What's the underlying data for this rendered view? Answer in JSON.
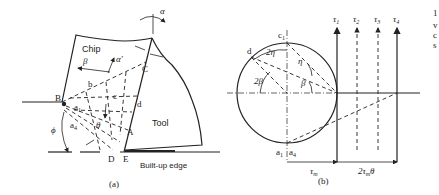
{
  "figure_a": {
    "caption": "(a)",
    "labels": {
      "chip": "Chip",
      "tool": "Tool",
      "built_up_edge": "Built-up edge",
      "alpha": "α",
      "alpha_prime": "α′",
      "beta": "β",
      "theta": "θ",
      "phi": "ϕ",
      "B": "B",
      "C": "C",
      "A": "A",
      "D": "D",
      "E": "E",
      "b": "b",
      "c": "c",
      "d": "d",
      "a1": "a",
      "a1_sub": "1",
      "a4": "a",
      "a4_sub": "4"
    }
  },
  "figure_b": {
    "caption": "(b)",
    "labels": {
      "c1": "c",
      "c1_sub": "1",
      "d": "d",
      "two_eta": "2η",
      "eta": "η",
      "two_beta": "2β",
      "beta": "β",
      "a1": "a",
      "a1_sub": "1",
      "a4": "a",
      "a4_sub": "4",
      "tau_m": "τ",
      "tau_m_sub": "m",
      "two_tau_m_theta": "2τ",
      "two_tau_m_theta_sub": "m",
      "two_tau_m_theta_tail": "θ",
      "tau1": "τ",
      "tau1_sub": "1",
      "tau2": "τ",
      "tau2_sub": "2",
      "tau3": "τ",
      "tau3_sub": "3",
      "tau4": "τ",
      "tau4_sub": "4"
    }
  },
  "margin_text": {
    "line1": "1",
    "line2": "v",
    "line3": "c",
    "line4": "s"
  }
}
